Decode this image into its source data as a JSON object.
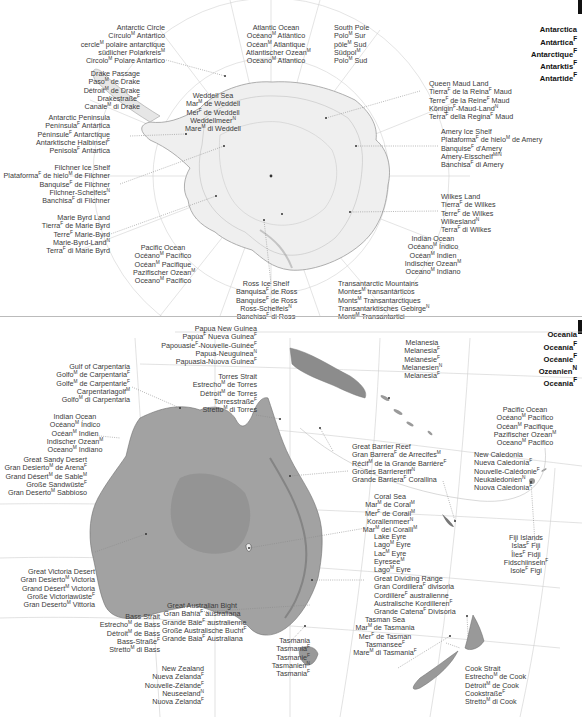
{
  "sections": {
    "antarctica": {
      "title_lines": [
        "Antarctica",
        "Antártica|F",
        "Antarctique|F",
        "Antarktis|F",
        "Antartide|F"
      ],
      "labels": [
        {
          "id": "antarctic-circle",
          "lines": [
            "Antarctic Circle",
            "Círculo|M Antártico",
            "cercle|M polaire antarctique",
            "südlicher Polarkreis|M",
            "Circolo|M Polare Antartico"
          ]
        },
        {
          "id": "drake-passage",
          "lines": [
            "Drake Passage",
            "Paso|M de Drake",
            "Détroit|M de Drake",
            "Drakestraße|F",
            "Canale|M di Drake"
          ]
        },
        {
          "id": "antarctic-peninsula",
          "lines": [
            "Antarctic Peninsula",
            "Península|F Antártica",
            "Péninsule|F Antarctique",
            "Antarktische Halbinsel|F",
            "Penisola|F Antartica"
          ]
        },
        {
          "id": "filchner-ice-shelf",
          "lines": [
            "Filchner Ice Shelf",
            "Plataforma|F de hielo|M de Filchner",
            "Banquise|F de Filchner",
            "Filchner-Schelfeis|N",
            "Banchisa|F di Filchner"
          ]
        },
        {
          "id": "marie-byrd-land",
          "lines": [
            "Marie Byrd Land",
            "Tierra|F de Marie Byrd",
            "Terre|F Marie-Byrd",
            "Marie-Byrd-Land|N",
            "Terra|F di Marie Byrd"
          ]
        },
        {
          "id": "pacific-ocean-ant",
          "lines": [
            "Pacific Ocean",
            "Océano|M Pacífico",
            "Océan|M Pacifique",
            "Pazifischer Ozean|M",
            "Oceano|M Pacifico"
          ]
        },
        {
          "id": "atlantic-ocean",
          "lines": [
            "Atlantic Ocean",
            "Océano|M Atlántico",
            "Océan|M Atlantique",
            "Atlantischer Ozean|M",
            "Oceano|M Atlantico"
          ]
        },
        {
          "id": "weddell-sea",
          "lines": [
            "Weddell Sea",
            "Mar|M de Weddell",
            "Mer|F de Weddell",
            "Weddellmeer|N",
            "Mare|M di Weddell"
          ]
        },
        {
          "id": "south-pole",
          "lines": [
            "South Pole",
            "Polo|M Sur",
            "pôle|M Sud",
            "Südpol|M",
            "Polo|M Sud"
          ]
        },
        {
          "id": "queen-maud-land",
          "lines": [
            "Queen Maud Land",
            "Tierra|F de la Reina|F Maud",
            "Terre|F de la Reine|F Maud",
            "Königin|F-Maud-Land|N",
            "Terra|F della Regina|F Maud"
          ]
        },
        {
          "id": "amery-ice-shelf",
          "lines": [
            "Amery Ice Shelf",
            "Plataforma|F de hielo|M de Amery",
            "Banquise|F d'Amery",
            "Amery-Eisschelf|M/N",
            "Banchisa|F di Amery"
          ]
        },
        {
          "id": "wilkes-land",
          "lines": [
            "Wilkes Land",
            "Tierra|F de Wilkes",
            "Terre|F de Wilkes",
            "Wilkesland|N",
            "Terra|F di Wilkes"
          ]
        },
        {
          "id": "indian-ocean-ant",
          "lines": [
            "Indian Ocean",
            "Océano|M Índico",
            "Océan|M Indien",
            "Indischer Ozean|M",
            "Oceano|M Indiano"
          ]
        },
        {
          "id": "ross-ice-shelf",
          "lines": [
            "Ross Ice Shelf",
            "Banquisa|F de Ross",
            "Banquise|F de Ross",
            "Ross-Schelfeis|N",
            "Banchisa|F di Ross"
          ]
        },
        {
          "id": "transantarctic-mountains",
          "lines": [
            "Transantarctic Mountains",
            "Montes|M transantárticos",
            "Monts|M Transantarctiques",
            "Transantarktisches Gebirge|N",
            "Monti|M Transantartici"
          ]
        }
      ]
    },
    "oceania": {
      "title_lines": [
        "Oceania",
        "Oceanía|F",
        "Océanie|F",
        "Ozeanien|N",
        "Oceania|F"
      ],
      "labels": [
        {
          "id": "papua-new-guinea",
          "lines": [
            "Papua New Guinea",
            "Papúa|F Nueva Guinea|F",
            "Papouasie|F-Nouvelle-Guinée|F",
            "Papua-Neuguinea|N",
            "Papuasia-Nuova Guinea|F"
          ]
        },
        {
          "id": "gulf-of-carpentaria",
          "lines": [
            "Gulf of Carpentaria",
            "Golfo|M de Carpentaria|F",
            "Golfe|M de Carpentarie|F",
            "Carpentariagolf|M",
            "Golfo|M di Carpentaria"
          ]
        },
        {
          "id": "torres-strait",
          "lines": [
            "Torres Strait",
            "Estrecho|M de Torres",
            "Détroit|M de Torres",
            "Torresstraße|F",
            "Stretto|M di Torres"
          ]
        },
        {
          "id": "indian-ocean-oc",
          "lines": [
            "Indian Ocean",
            "Océano|M Índico",
            "Océan|M Indien",
            "Indischer Ozean|M",
            "Oceano|M Indiano"
          ]
        },
        {
          "id": "great-sandy-desert",
          "lines": [
            "Great Sandy Desert",
            "Gran Desierto|M de Arena|F",
            "Grand Désert|M de Sable|M",
            "Große Sandwüste|F",
            "Gran Deserto|M Sabbioso"
          ]
        },
        {
          "id": "melanesia",
          "lines": [
            "Melanesia",
            "Melanesia|F",
            "Mélanésie|F",
            "Melanesien|N",
            "Melanesia|F"
          ]
        },
        {
          "id": "pacific-ocean-oc",
          "lines": [
            "Pacific Ocean",
            "Océano|M Pacífico",
            "Océan|M Pacifique",
            "Pazifischer Ozean|M",
            "Oceano|M Pacifico"
          ]
        },
        {
          "id": "great-barrier-reef",
          "lines": [
            "Great Barrier Reef",
            "Gran Barrera|F de Arrecifes|M",
            "Récif|M de la Grande Barrière|F",
            "Großes Barriereriff|N",
            "Grande Barriera|F Corallina"
          ]
        },
        {
          "id": "new-caledonia",
          "lines": [
            "New Caledonia",
            "Nueva Caledonia|F",
            "Nouvelle-Calédonie|F",
            "Neukaledonien|N",
            "Nuova Caledonia|F"
          ]
        },
        {
          "id": "coral-sea",
          "lines": [
            "Coral Sea",
            "Mar|M de Coral|M",
            "Mer|F de Corail|M",
            "Korallenmeer|N",
            "Mar|M dei Coralli|M"
          ]
        },
        {
          "id": "lake-eyre",
          "lines": [
            "Lake Eyre",
            "Lago|M Eyre",
            "Lac|M Eyre",
            "Eyresee|M",
            "Lago|M Eyre"
          ]
        },
        {
          "id": "fiji-islands",
          "lines": [
            "Fiji Islands",
            "Islas|F Fiji",
            "Îles|F Fidji",
            "Fidschiinseln|F",
            "Isole|F Figi"
          ]
        },
        {
          "id": "great-dividing-range",
          "lines": [
            "Great Dividing Range",
            "Gran Cordillera|F divisoria",
            "Cordillère|F australienne",
            "Australische Kordilleren|F",
            "Grande Catena|F Divisoria"
          ]
        },
        {
          "id": "great-victoria-desert",
          "lines": [
            "Great Victoria Desert",
            "Gran Desierto|M Victoria",
            "Grand Désert|M Victoria",
            "Große Victoriawüste|F",
            "Gran Deserto|M Vittoria"
          ]
        },
        {
          "id": "great-australian-bight",
          "lines": [
            "Great Australian Bight",
            "Gran Bahía|F australiana",
            "Grande Baie|F australienne",
            "Große Australische Bucht|F",
            "Grande Baia|F Australiana"
          ]
        },
        {
          "id": "tasman-sea",
          "lines": [
            "Tasman Sea",
            "Mar|M de Tasmania",
            "Mer|F de Tasman",
            "Tasmansee|F",
            "Mare|M di Tasmania|F"
          ]
        },
        {
          "id": "bass-strait",
          "lines": [
            "Bass Strait",
            "Estrecho|M de Bass",
            "Détroit|M de Bass",
            "Bass-Straße|F",
            "Stretto|M di Bass"
          ]
        },
        {
          "id": "tasmania",
          "lines": [
            "Tasmania",
            "Tasmania|F",
            "Tasmanie|F",
            "Tasmanien|N",
            "Tasmania|F"
          ]
        },
        {
          "id": "new-zealand",
          "lines": [
            "New Zealand",
            "Nueva Zelanda|F",
            "Nouvelle-Zélande|F",
            "Neuseeland|N",
            "Nuova Zelanda|F"
          ]
        },
        {
          "id": "cook-strait",
          "lines": [
            "Cook Strait",
            "Estrecho|M de Cook",
            "Détroit|M de Cook",
            "Cookstraße|F",
            "Stretto|M di Cook"
          ]
        }
      ]
    }
  },
  "colors": {
    "text": "#3a3a3a",
    "title": "#111111",
    "land_dark": "#7a7a7a",
    "land_light": "#cfcfcf",
    "graticule": "#c8c8c8",
    "leader": "#888888"
  }
}
